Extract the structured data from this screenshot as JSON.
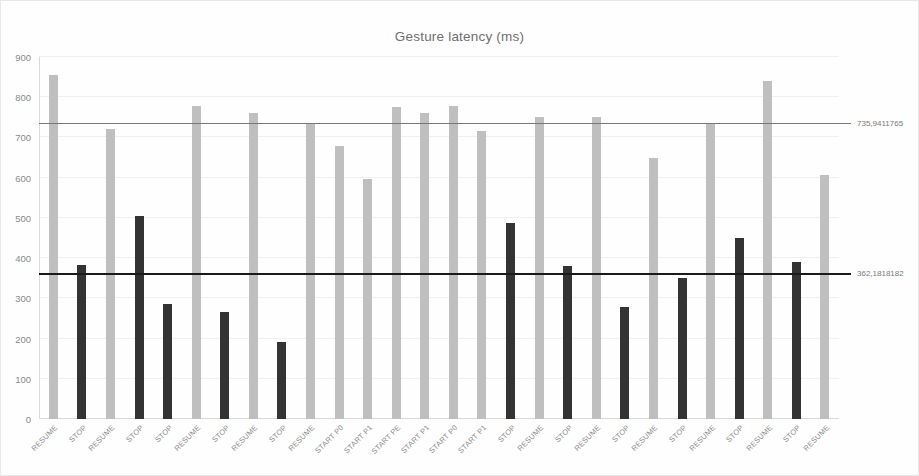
{
  "chart_data": {
    "type": "bar",
    "title": "Gesture latency (ms)",
    "xlabel": "",
    "ylabel": "",
    "ylim": [
      0,
      900
    ],
    "ytick_step": 100,
    "yticks": [
      0,
      100,
      200,
      300,
      400,
      500,
      600,
      700,
      800,
      900
    ],
    "grid": true,
    "legend": "none",
    "categories": [
      "RESUME",
      "STOP",
      "RESUME",
      "STOP",
      "STOP",
      "RESUME",
      "STOP",
      "RESUME",
      "STOP",
      "RESUME",
      "START P0",
      "START P1",
      "START PE",
      "START P1",
      "START P0",
      "START P1",
      "STOP",
      "RESUME",
      "STOP",
      "RESUME",
      "STOP",
      "RESUME",
      "STOP",
      "RESUME",
      "STOP",
      "RESUME",
      "STOP",
      "RESUME"
    ],
    "values": [
      855,
      382,
      720,
      505,
      287,
      778,
      265,
      760,
      192,
      733,
      678,
      597,
      775,
      762,
      778,
      717,
      487,
      752,
      380,
      750,
      278,
      650,
      350,
      733,
      450,
      840,
      390,
      607
    ],
    "bar_styles": [
      "light",
      "dark",
      "light",
      "dark",
      "dark",
      "light",
      "dark",
      "light",
      "dark",
      "light",
      "light",
      "light",
      "light",
      "light",
      "light",
      "light",
      "dark",
      "light",
      "dark",
      "light",
      "dark",
      "light",
      "dark",
      "light",
      "dark",
      "light",
      "dark",
      "light"
    ],
    "reference_lines": [
      {
        "label": "735,9411765",
        "value": 735.9411765,
        "style": "upper"
      },
      {
        "label": "362,1818182",
        "value": 362.1818182,
        "style": "lower"
      }
    ],
    "colors": {
      "bar_light": "#bfbfbf",
      "bar_dark": "#333333",
      "refline_upper": "#777777",
      "refline_lower": "#1a1a1a",
      "grid": "#f0f0f0",
      "axis_text": "#8a8a8a",
      "title_text": "#6f6f6f"
    }
  }
}
